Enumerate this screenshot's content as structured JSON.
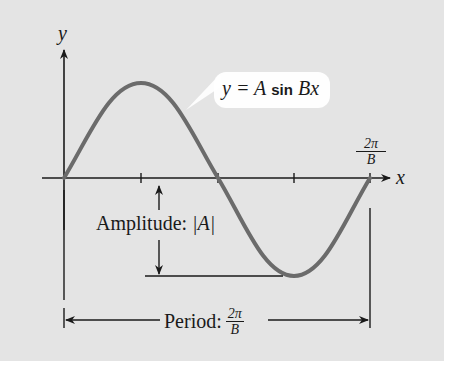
{
  "diagram": {
    "axes": {
      "x_label": "x",
      "y_label": "y"
    },
    "curve_label": {
      "lhs": "y = A",
      "fn": "sin",
      "rhs": "Bx"
    },
    "tick_label": {
      "numerator": "2π",
      "denominator": "B"
    },
    "amplitude_label": {
      "text": "Amplitude: ",
      "value": "|A|"
    },
    "period_label": {
      "text": "Period: ",
      "numerator": "2π",
      "denominator": "B"
    },
    "colors": {
      "background": "#e4e4e4",
      "curve": "#6b6b6b",
      "lines": "#1a1a1a",
      "callout": "#ffffff"
    }
  }
}
